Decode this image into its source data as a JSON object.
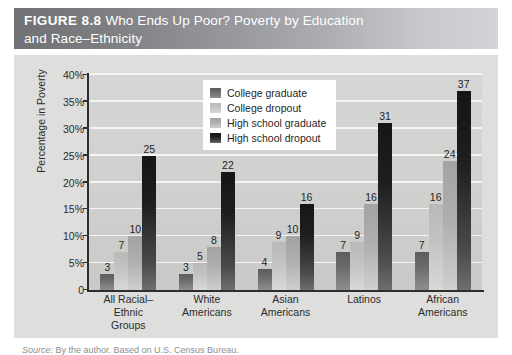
{
  "figure": {
    "number_label": "FIGURE 8.8",
    "title_line1": "Who Ends Up Poor? Poverty by Education",
    "title_line2": "and Race–Ethnicity",
    "source_label": "Source:",
    "source_text": " By the author. Based on U.S. Census Bureau."
  },
  "colors": {
    "title_bar_dark": "#6f7175",
    "title_bar_light": "#d2d4d7",
    "panel_background": "#dededc",
    "plot_background": "#d2d2d0",
    "gridline": "#f4f4f2",
    "axis": "#2e2e2e",
    "series_college_graduate": "#6b6b6b",
    "series_college_dropout": "#c3c3c1",
    "series_high_school_graduate": "#aeaeac",
    "series_high_school_dropout": "#1e1e1e",
    "legend_background": "#ffffff",
    "text": "#2b2b2b"
  },
  "chart_data": {
    "type": "bar",
    "title": "Who Ends Up Poor? Poverty by Education and Race–Ethnicity",
    "xlabel": "",
    "ylabel": "Percentage in Poverty",
    "ylim": [
      0,
      40
    ],
    "ytick_labels": [
      "0",
      "5%",
      "10%",
      "15%",
      "20%",
      "25%",
      "30%",
      "35%",
      "40%"
    ],
    "ytick_values": [
      0,
      5,
      10,
      15,
      20,
      25,
      30,
      35,
      40
    ],
    "grid": true,
    "legend_position": "top-center-inside",
    "categories": [
      "All Racial–Ethnic Groups",
      "White Americans",
      "Asian Americans",
      "Latinos",
      "African Americans"
    ],
    "category_lines": [
      [
        "All Racial–Ethnic",
        "Groups"
      ],
      [
        "White",
        "Americans"
      ],
      [
        "Asian",
        "Americans"
      ],
      [
        "Latinos",
        ""
      ],
      [
        "African",
        "Americans"
      ]
    ],
    "series": [
      {
        "name": "College graduate",
        "values": [
          3,
          3,
          4,
          7,
          7
        ]
      },
      {
        "name": "College dropout",
        "values": [
          7,
          5,
          9,
          9,
          16
        ]
      },
      {
        "name": "High school graduate",
        "values": [
          10,
          8,
          10,
          16,
          24
        ]
      },
      {
        "name": "High school dropout",
        "values": [
          25,
          22,
          16,
          31,
          37
        ]
      }
    ]
  }
}
